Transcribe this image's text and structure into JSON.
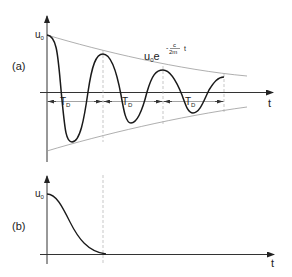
{
  "figure": {
    "panel_a": {
      "label": "(a)",
      "y_label": "u",
      "y_label_sub": "0",
      "x_label": "t",
      "envelope_formula": {
        "base": "u",
        "base_sub": "0",
        "e": "e",
        "exp_sign": "-",
        "exp_num": "c",
        "exp_den": "2m",
        "exp_var": "t"
      },
      "period_label": "T",
      "period_sub": "D",
      "period_count": 3,
      "description": "Underdamped oscillation decaying within exponential envelope"
    },
    "panel_b": {
      "label": "(b)",
      "y_label": "u",
      "y_label_sub": "0",
      "x_label": "t",
      "description": "Critically/over-damped monotonic decay to zero"
    },
    "colors": {
      "curve": "#1a1a1a",
      "axis": "#333333",
      "envelope": "#9a9a9a",
      "guide": "#b0b0b0",
      "text": "#222222"
    }
  }
}
